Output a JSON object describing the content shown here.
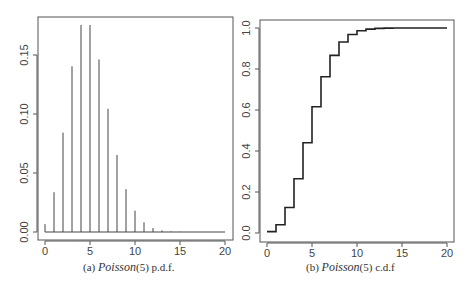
{
  "chart_data": [
    {
      "type": "bar",
      "subtype": "stem",
      "title": "",
      "caption": {
        "prefix": "(a)",
        "dist": "Poisson",
        "param": "(5)",
        "suffix": "p.d.f."
      },
      "xlabel": "",
      "ylabel": "",
      "xlim": [
        0,
        20
      ],
      "ylim": [
        0,
        0.18
      ],
      "xticks": [
        "0",
        "5",
        "10",
        "15",
        "20"
      ],
      "yticks": [
        "0.00",
        "0.05",
        "0.10",
        "0.15"
      ],
      "grid": false,
      "x": [
        0,
        1,
        2,
        3,
        4,
        5,
        6,
        7,
        8,
        9,
        10,
        11,
        12,
        13,
        14,
        15,
        16,
        17,
        18,
        19,
        20
      ],
      "values": [
        0.0067,
        0.0337,
        0.0842,
        0.1404,
        0.1755,
        0.1755,
        0.1462,
        0.1044,
        0.0653,
        0.0363,
        0.0181,
        0.0082,
        0.0034,
        0.0013,
        0.0005,
        0.0002,
        0.0,
        0.0,
        0.0,
        0.0,
        0.0
      ]
    },
    {
      "type": "line",
      "subtype": "step",
      "title": "",
      "caption": {
        "prefix": "(b)",
        "dist": "Poisson",
        "param": "(5)",
        "suffix": "c.d.f"
      },
      "xlabel": "",
      "ylabel": "",
      "xlim": [
        0,
        20
      ],
      "ylim": [
        0,
        1.0
      ],
      "xticks": [
        "0",
        "5",
        "10",
        "15",
        "20"
      ],
      "yticks": [
        "0.0",
        "0.2",
        "0.4",
        "0.6",
        "0.8",
        "1.0"
      ],
      "grid": false,
      "x": [
        0,
        1,
        2,
        3,
        4,
        5,
        6,
        7,
        8,
        9,
        10,
        11,
        12,
        13,
        14,
        15,
        16,
        17,
        18,
        19,
        20
      ],
      "values": [
        0.0067,
        0.0404,
        0.1247,
        0.265,
        0.4405,
        0.616,
        0.7622,
        0.8666,
        0.9319,
        0.9682,
        0.9863,
        0.9945,
        0.998,
        0.9993,
        0.9998,
        0.9999,
        1.0,
        1.0,
        1.0,
        1.0,
        1.0
      ]
    }
  ],
  "captions": {
    "a_prefix": "(a)",
    "a_dist": "Poisson",
    "a_param": "(5)",
    "a_suffix": "p.d.f.",
    "b_prefix": "(b)",
    "b_dist": "Poisson",
    "b_param": "(5)",
    "b_suffix": "c.d.f"
  },
  "colors": {
    "axis": "#555555",
    "stem": "#444444",
    "step": "#222222",
    "text": "#444444"
  }
}
